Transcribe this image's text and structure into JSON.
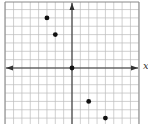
{
  "chart_data": {
    "type": "scatter",
    "title": "",
    "xlabel": "x",
    "ylabel": "",
    "grid": true,
    "xlim": [
      -8,
      8
    ],
    "ylim": [
      -7,
      8
    ],
    "points": [
      {
        "x": -3,
        "y": 6
      },
      {
        "x": -2,
        "y": 4
      },
      {
        "x": 0,
        "y": 0
      },
      {
        "x": 2,
        "y": -4
      },
      {
        "x": 4,
        "y": -6
      }
    ],
    "colors": {
      "grid": "#bbbbbb",
      "axis": "#333333",
      "point": "#111111",
      "border": "#888888"
    }
  }
}
